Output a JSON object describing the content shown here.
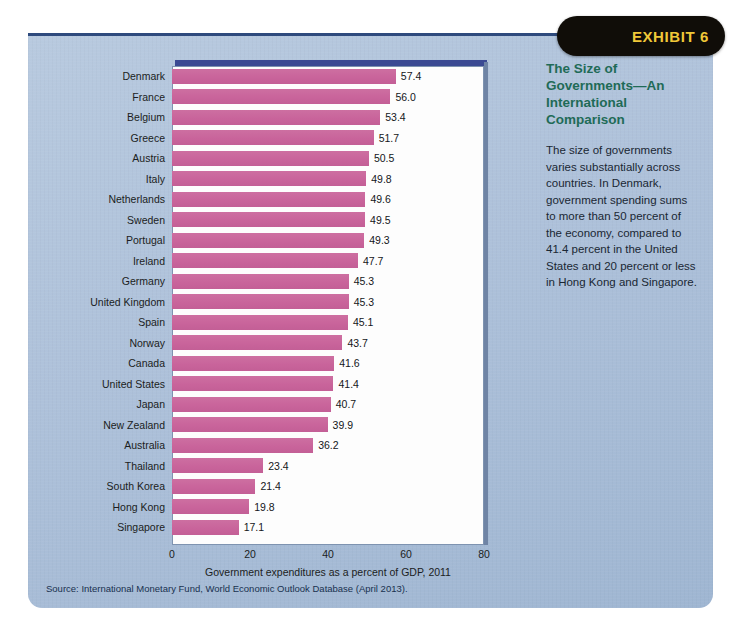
{
  "exhibit": {
    "tab_label": "EXHIBIT 6",
    "tab_bg": "#100d08",
    "tab_text_color": "#f0c838"
  },
  "sidebar": {
    "title": "The Size of Governments—An International Comparison",
    "body": "The size of governments varies substantially across countries. In Denmark, government spending sums to more than 50 percent of the economy, compared to 41.4 percent in the United States and 20 percent or less in Hong Kong and Singapore.",
    "title_color": "#1f6b57",
    "body_color": "#1a2733"
  },
  "source": {
    "text": "Source: International Monetary Fund, World Economic Outlook Database (April 2013)."
  },
  "panel": {
    "bg_color": "#aec1da",
    "top_border_color": "#2e4a7d"
  },
  "chart_data": {
    "type": "bar",
    "orientation": "horizontal",
    "title": "",
    "xlabel": "Government expenditures as a percent of GDP, 2011",
    "ylabel": "",
    "xlim": [
      0,
      80
    ],
    "xticks": [
      0,
      20,
      40,
      60,
      80
    ],
    "grid": false,
    "legend": "none",
    "bar_color": "#c9649b",
    "plot_bg": "#fdfdfd",
    "categories": [
      "Denmark",
      "France",
      "Belgium",
      "Greece",
      "Austria",
      "Italy",
      "Netherlands",
      "Sweden",
      "Portugal",
      "Ireland",
      "Germany",
      "United Kingdom",
      "Spain",
      "Norway",
      "Canada",
      "United States",
      "Japan",
      "New Zealand",
      "Australia",
      "Thailand",
      "South Korea",
      "Hong Kong",
      "Singapore"
    ],
    "values": [
      57.4,
      56.0,
      53.4,
      51.7,
      50.5,
      49.8,
      49.6,
      49.5,
      49.3,
      47.7,
      45.3,
      45.3,
      45.1,
      43.7,
      41.6,
      41.4,
      40.7,
      39.9,
      36.2,
      23.4,
      21.4,
      19.8,
      17.1
    ],
    "value_labels": [
      "57.4",
      "56.0",
      "53.4",
      "51.7",
      "50.5",
      "49.8",
      "49.6",
      "49.5",
      "49.3",
      "47.7",
      "45.3",
      "45.3",
      "45.1",
      "43.7",
      "41.6",
      "41.4",
      "40.7",
      "39.9",
      "36.2",
      "23.4",
      "21.4",
      "19.8",
      "17.1"
    ]
  }
}
